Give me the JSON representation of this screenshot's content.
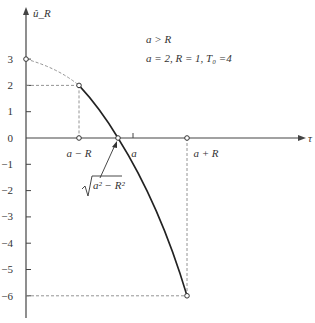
{
  "diagram": {
    "y_axis_label": "û_R",
    "x_axis_label": "τ",
    "conditions": {
      "line1": "a > R",
      "line2": "a = 2,  R = 1,  T₀ =4"
    },
    "y_ticks": [
      "3",
      "2",
      "1",
      "0",
      "−1",
      "−2",
      "−3",
      "−4",
      "−5",
      "−6"
    ],
    "x_labels": {
      "a_minus_R": "a − R",
      "a": "a",
      "a_plus_R": "a + R"
    },
    "root_annotation": "√(a² − R²)",
    "root_radicand": "a² − R²",
    "points": [
      {
        "name": "y-intercept",
        "tau": 0,
        "u": 3
      },
      {
        "name": "start",
        "tau": "a−R",
        "u": 2
      },
      {
        "name": "a-minus-R-on-axis",
        "tau": "a−R",
        "u": 0
      },
      {
        "name": "zero-crossing",
        "tau": "√(a²−R²)",
        "u": 0
      },
      {
        "name": "a-plus-R-on-axis",
        "tau": "a+R",
        "u": 0
      },
      {
        "name": "end",
        "tau": "a+R",
        "u": -6
      }
    ],
    "colors": {
      "axis": "#444444",
      "curve": "#222222",
      "dashed": "#888888"
    }
  }
}
